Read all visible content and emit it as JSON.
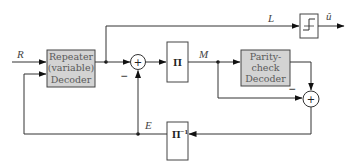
{
  "diagram": {
    "type": "block-diagram",
    "blocks": {
      "repeater_decoder": {
        "lines": [
          "Repeater",
          "(variable)",
          "Decoder"
        ],
        "fill": "#d3d3d3"
      },
      "interleaver": {
        "label": "Π"
      },
      "parity_check_decoder": {
        "lines": [
          "Parity-",
          "check",
          "Decoder"
        ],
        "fill": "#d3d3d3"
      },
      "deinterleaver": {
        "label": "Π",
        "superscript": "−1"
      },
      "hard_decision": {
        "icon": "step-function-icon"
      }
    },
    "signals": {
      "input": "R",
      "repeater_output": "L",
      "interleaved": "M",
      "extrinsic": "E",
      "output": "û"
    },
    "summers": {
      "summer1": {
        "symbol": "+",
        "minus_sign": "−"
      },
      "summer2": {
        "symbol": "+",
        "minus_sign": "−"
      }
    },
    "colors": {
      "line": "#333333",
      "box_fill": "#d3d3d3",
      "box_border": "#444444"
    }
  }
}
